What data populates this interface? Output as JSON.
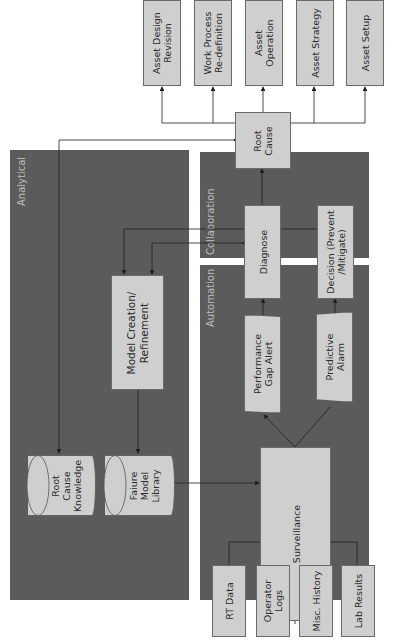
{
  "panels": {
    "analytical": "Analytical",
    "collaboration": "Collaboration",
    "automation": "Automation"
  },
  "inputs": [
    {
      "label": "RT Data"
    },
    {
      "label": "Operator\nLogs"
    },
    {
      "label": "Misc. History"
    },
    {
      "label": "Lab Results"
    }
  ],
  "nodes": {
    "surveillance": "Surveillance",
    "performance_gap_alert": "Performance\nGap Alert",
    "predictive_alarm": "Predictive\nAlarm",
    "diagnose": "Diagnose",
    "decision": "Decision (Prevent\n/Mitigate)",
    "root_cause": "Root\nCause",
    "model_creation": "Model Creation/\nRefinement",
    "root_cause_knowledge": "Root\nCause\nKnowledge",
    "failure_model_library": "Faiure\nModel\nLibrary"
  },
  "outputs": [
    {
      "label": "Asset Design\nRevision"
    },
    {
      "label": "Work Process\nRe-definition"
    },
    {
      "label": "Asset\nOperation"
    },
    {
      "label": "Asset Strategy"
    },
    {
      "label": "Asset Setup"
    }
  ],
  "colors": {
    "panel": "#5b5b5b",
    "box": "#cfcfcf",
    "line": "#1e1e1e",
    "panel_label": "#bdbdbd"
  }
}
